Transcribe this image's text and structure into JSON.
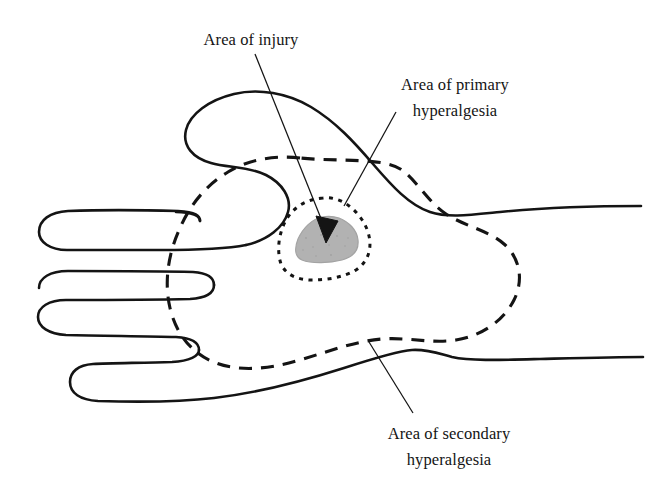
{
  "figure": {
    "type": "anatomical-line-diagram",
    "background_color": "#ffffff",
    "line_color": "#141414",
    "injury_fill_color": "#b2b2b2"
  },
  "labels": {
    "injury": {
      "lines": [
        "Area of injury"
      ],
      "leader_from": [
        255,
        54
      ],
      "leader_to": [
        326,
        231
      ],
      "has_arrowhead": true
    },
    "primary": {
      "lines": [
        "Area of primary",
        "hyperalgesia"
      ],
      "leader_from": [
        396,
        112
      ],
      "leader_to": [
        344,
        206
      ],
      "has_arrowhead": false
    },
    "secondary": {
      "lines": [
        "Area of secondary",
        "hyperalgesia"
      ],
      "leader_from": [
        369,
        342
      ],
      "leader_to": [
        413,
        413
      ],
      "has_arrowhead": false
    }
  },
  "regions": {
    "injury": {
      "name": "Area of injury",
      "style": "solid gray shaded blob",
      "fill": "#b2b2b2"
    },
    "primary_hyperalgesia": {
      "name": "Area of primary hyperalgesia",
      "style": "fine dotted boundary",
      "dash": "4 5"
    },
    "secondary_hyperalgesia": {
      "name": "Area of secondary hyperalgesia",
      "style": "long dashed boundary",
      "dash": "13 9"
    }
  }
}
